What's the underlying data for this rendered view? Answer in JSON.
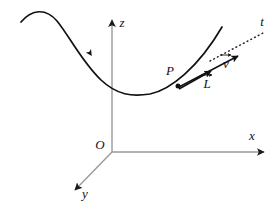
{
  "figure": {
    "kind": "vector-kinematics-diagram",
    "background_color": "#ffffff",
    "curve_color": "#111111",
    "axis_color": "#9a9a9a",
    "tangent_color": "#222222"
  },
  "axes": {
    "origin": {
      "label": "O",
      "x": 100,
      "y": 145
    },
    "z_axis": {
      "label": "z",
      "label_x": 122,
      "label_y": 23,
      "tip_x": 112,
      "tip_y": 14,
      "base_x": 112,
      "base_y": 152
    },
    "x_axis": {
      "label": "x",
      "label_x": 252,
      "label_y": 136,
      "tip_x": 270,
      "tip_y": 152,
      "base_x": 112,
      "base_y": 152
    },
    "y_axis": {
      "label": "y",
      "label_x": 84,
      "label_y": 194,
      "tip_x": 70,
      "tip_y": 194,
      "base_x": 112,
      "base_y": 152
    }
  },
  "curve": {
    "name": "trajectory-curve",
    "path": "M 21,22 C 32,9 46,8 57,21 C 70,37 82,62 101,80 C 117,95 132,97 150,94 C 170,90 198,68 222,27",
    "direction_arrow": {
      "x": 96,
      "y": 57,
      "angle_deg": 57
    }
  },
  "point_p": {
    "label": "P",
    "label_x": 170,
    "label_y": 72,
    "dot_x": 178,
    "dot_y": 86
  },
  "tangent_line": {
    "label": "t",
    "label_x": 262,
    "label_y": 22,
    "style": "dotted",
    "start_x": 212,
    "start_y": 60,
    "end_x": 266,
    "end_y": 31
  },
  "vector_v": {
    "label": "v",
    "accent": "arrow",
    "label_x": 226,
    "label_y": 63,
    "tail_x": 179,
    "tail_y": 87,
    "tip_x": 241,
    "tip_y": 54
  },
  "vector_l": {
    "label": "L",
    "accent": "arrow",
    "label_x": 207,
    "label_y": 83,
    "tail_x": 179,
    "tail_y": 88,
    "tip_x": 214,
    "tip_y": 69
  }
}
